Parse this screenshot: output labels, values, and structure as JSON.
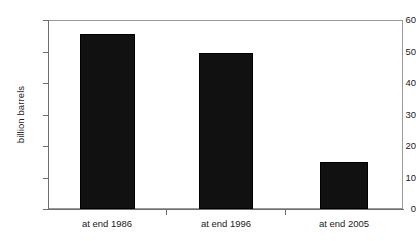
{
  "chart_data": {
    "type": "bar",
    "title": "",
    "xlabel": "",
    "ylabel": "billion barrels",
    "categories": [
      "at end 1986",
      "at end 1996",
      "at end 2005"
    ],
    "values": [
      55.5,
      49.5,
      15.0
    ],
    "ylim": [
      0,
      60
    ],
    "yticks": [
      "0",
      "10",
      "20",
      "30",
      "40",
      "50",
      "60"
    ],
    "ytick_values": [
      0,
      10,
      20,
      30,
      40,
      50,
      60
    ],
    "grid": false,
    "legend": "none",
    "bar_color": "#111111",
    "axis_color": "#6e6e6e",
    "frame_color": "#9a9a9a",
    "background": "#ffffff",
    "text_color": "#1a1a1a"
  }
}
